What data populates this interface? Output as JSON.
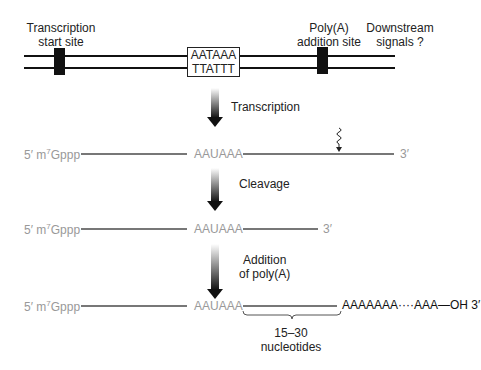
{
  "gene": {
    "labels": {
      "transcription_start": [
        "Transcription",
        "start site"
      ],
      "polya_site": [
        "Poly(A)",
        "addition site"
      ],
      "downstream": [
        "Downstream",
        "signals ?"
      ]
    },
    "signal_box": [
      "AATAAA",
      "TTATTT"
    ]
  },
  "steps": [
    {
      "label": "Transcription"
    },
    {
      "label": "Cleavage"
    },
    {
      "label_lines": [
        "Addition",
        "of poly(A)"
      ]
    }
  ],
  "rna": {
    "five_prime": "5′ m",
    "cap_sup": "7",
    "cap_rest": "Gppp",
    "signal": "AAUAAA",
    "three_prime": "3′",
    "polya_tail": "AAAAAAA····AAA—OH 3′"
  },
  "brace": {
    "lines": [
      "15–30",
      "nucleotides"
    ]
  }
}
